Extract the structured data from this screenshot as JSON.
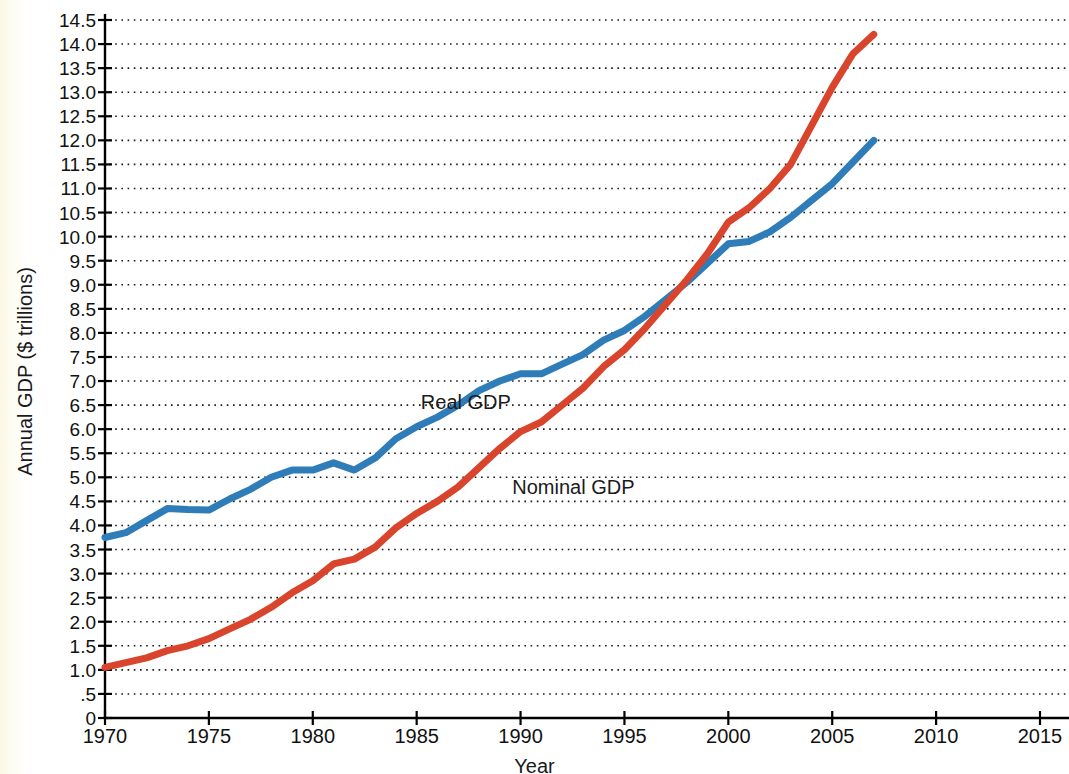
{
  "chart_data": {
    "type": "line",
    "title": "",
    "xlabel": "Year",
    "ylabel": "Annual GDP ($ trillions)",
    "xlim": [
      1970,
      2015
    ],
    "ylim": [
      0,
      14.5
    ],
    "xticks": [
      1970,
      1975,
      1980,
      1985,
      1990,
      1995,
      2000,
      2005,
      2010,
      2015
    ],
    "xtick_labels": [
      "1970",
      "1975",
      "1980",
      "1985",
      "1990",
      "1995",
      "2000",
      "2005",
      "2010",
      "2015"
    ],
    "yticks": [
      0,
      0.5,
      1.0,
      1.5,
      2.0,
      2.5,
      3.0,
      3.5,
      4.0,
      4.5,
      5.0,
      5.5,
      6.0,
      6.5,
      7.0,
      7.5,
      8.0,
      8.5,
      9.0,
      9.5,
      10.0,
      10.5,
      11.0,
      11.5,
      12.0,
      12.5,
      13.0,
      13.5,
      14.0,
      14.5
    ],
    "ytick_labels": [
      "0",
      ".5",
      "1.0",
      "1.5",
      "2.0",
      "2.5",
      "3.0",
      "3.5",
      "4.0",
      "4.5",
      "5.0",
      "5.5",
      "6.0",
      "6.5",
      "7.0",
      "7.5",
      "8.0",
      "8.5",
      "9.0",
      "9.5",
      "10.0",
      "10.5",
      "11.0",
      "11.5",
      "12.0",
      "12.5",
      "13.0",
      "13.5",
      "14.0",
      "14.5"
    ],
    "grid": true,
    "grid_style": "dotted-horizontal",
    "legend": "inline-annotations",
    "series": [
      {
        "name": "Real GDP",
        "color": "#2e7cb8",
        "label_x": 1985.2,
        "label_y": 6.55,
        "x": [
          1970,
          1971,
          1972,
          1973,
          1974,
          1975,
          1976,
          1977,
          1978,
          1979,
          1980,
          1981,
          1982,
          1983,
          1984,
          1985,
          1986,
          1987,
          1988,
          1989,
          1990,
          1991,
          1992,
          1993,
          1994,
          1995,
          1996,
          1997,
          1998,
          1999,
          2000,
          2001,
          2002,
          2003,
          2004,
          2005,
          2006,
          2007
        ],
        "values": [
          3.75,
          3.85,
          4.1,
          4.35,
          4.33,
          4.32,
          4.55,
          4.75,
          5.0,
          5.15,
          5.15,
          5.3,
          5.15,
          5.4,
          5.8,
          6.05,
          6.25,
          6.5,
          6.8,
          7.0,
          7.15,
          7.15,
          7.35,
          7.55,
          7.85,
          8.05,
          8.35,
          8.7,
          9.05,
          9.45,
          9.85,
          9.9,
          10.1,
          10.4,
          10.75,
          11.1,
          11.55,
          12.0
        ]
      },
      {
        "name": "Nominal GDP",
        "color": "#d9442c",
        "label_x": 1989.6,
        "label_y": 4.78,
        "x": [
          1970,
          1971,
          1972,
          1973,
          1974,
          1975,
          1976,
          1977,
          1978,
          1979,
          1980,
          1981,
          1982,
          1983,
          1984,
          1985,
          1986,
          1987,
          1988,
          1989,
          1990,
          1991,
          1992,
          1993,
          1994,
          1995,
          1996,
          1997,
          1998,
          1999,
          2000,
          2001,
          2002,
          2003,
          2004,
          2005,
          2006,
          2007
        ],
        "values": [
          1.05,
          1.15,
          1.25,
          1.4,
          1.5,
          1.65,
          1.85,
          2.05,
          2.3,
          2.6,
          2.85,
          3.2,
          3.3,
          3.55,
          3.95,
          4.25,
          4.5,
          4.8,
          5.2,
          5.6,
          5.95,
          6.15,
          6.5,
          6.85,
          7.3,
          7.65,
          8.1,
          8.6,
          9.1,
          9.65,
          10.3,
          10.6,
          11.0,
          11.5,
          12.3,
          13.1,
          13.8,
          14.2
        ]
      }
    ]
  },
  "chart": {
    "ylabel": "Annual GDP ($ trillions)",
    "xlabel": "Year"
  }
}
